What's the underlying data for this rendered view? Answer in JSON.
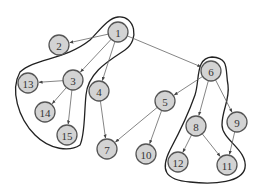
{
  "diagram": {
    "type": "directed-graph",
    "node_radius": 10,
    "colors": {
      "node_fill": "#d3d3d3",
      "node_stroke": "#555555",
      "edge": "#666666",
      "contour": "#222222"
    },
    "nodes": [
      {
        "id": "1",
        "label": "1",
        "x": 118,
        "y": 32
      },
      {
        "id": "2",
        "label": "2",
        "x": 59,
        "y": 45
      },
      {
        "id": "3",
        "label": "3",
        "x": 73,
        "y": 80
      },
      {
        "id": "4",
        "label": "4",
        "x": 99,
        "y": 91
      },
      {
        "id": "5",
        "label": "5",
        "x": 165,
        "y": 101
      },
      {
        "id": "6",
        "label": "6",
        "x": 211,
        "y": 71
      },
      {
        "id": "7",
        "label": "7",
        "x": 107,
        "y": 149
      },
      {
        "id": "8",
        "label": "8",
        "x": 196,
        "y": 126
      },
      {
        "id": "9",
        "label": "9",
        "x": 237,
        "y": 122
      },
      {
        "id": "10",
        "label": "10",
        "x": 146,
        "y": 154
      },
      {
        "id": "11",
        "label": "11",
        "x": 227,
        "y": 165
      },
      {
        "id": "12",
        "label": "12",
        "x": 178,
        "y": 162
      },
      {
        "id": "13",
        "label": "13",
        "x": 28,
        "y": 83
      },
      {
        "id": "14",
        "label": "14",
        "x": 45,
        "y": 112
      },
      {
        "id": "15",
        "label": "15",
        "x": 67,
        "y": 135
      }
    ],
    "edges": [
      {
        "from": "1",
        "to": "2"
      },
      {
        "from": "1",
        "to": "3"
      },
      {
        "from": "1",
        "to": "4"
      },
      {
        "from": "1",
        "to": "6"
      },
      {
        "from": "3",
        "to": "13"
      },
      {
        "from": "3",
        "to": "14"
      },
      {
        "from": "3",
        "to": "15"
      },
      {
        "from": "4",
        "to": "7"
      },
      {
        "from": "6",
        "to": "5"
      },
      {
        "from": "6",
        "to": "8"
      },
      {
        "from": "6",
        "to": "9"
      },
      {
        "from": "5",
        "to": "7"
      },
      {
        "from": "5",
        "to": "10"
      },
      {
        "from": "8",
        "to": "12"
      },
      {
        "from": "8",
        "to": "11"
      },
      {
        "from": "9",
        "to": "11"
      }
    ],
    "groups": [
      {
        "id": "group-left",
        "members": [
          "1",
          "2",
          "3",
          "13",
          "14",
          "15"
        ],
        "path": "M 118 17 C 135 15, 140 40, 125 50 C 110 60, 88 72, 86 95 C 84 115, 85 135, 80 145 C 70 152, 50 150, 35 135 C 18 118, 10 90, 20 72 C 35 58, 65 60, 90 40 C 100 30, 108 18, 118 17 Z"
      },
      {
        "id": "group-right",
        "members": [
          "6",
          "8",
          "12",
          "11",
          "9"
        ],
        "path": "M 212 57 C 230 58, 225 70, 228 85 C 230 100, 222 110, 222 125 C 222 140, 248 150, 245 168 C 242 182, 215 185, 190 182 C 165 180, 160 170, 170 150 C 178 135, 188 115, 195 95 C 200 80, 195 58, 212 57 Z"
      }
    ]
  }
}
